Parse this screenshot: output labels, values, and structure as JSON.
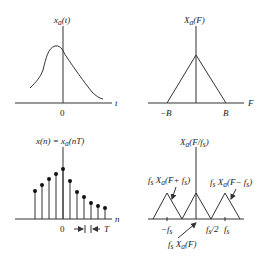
{
  "panels": {
    "analog_signal": {
      "title": "x_a(t)",
      "title_main": "x",
      "title_sub": "a",
      "title_rest": "(t)",
      "x_axis_label": "t",
      "origin_label": "0"
    },
    "analog_spectrum": {
      "title_main": "X",
      "title_sub": "a",
      "title_rest": "(F)",
      "x_axis_label": "F",
      "tick_left": "−B",
      "tick_right": "B"
    },
    "sampled_signal": {
      "title_main": "x(n) = x",
      "title_sub": "a",
      "title_rest": "(nT)",
      "x_axis_label": "n",
      "origin_label": "0",
      "period_label": "T",
      "sample_heights": [
        28,
        34,
        40,
        45,
        50,
        38,
        27,
        22,
        16,
        13,
        11
      ]
    },
    "sampled_spectrum": {
      "title_main": "X",
      "title_sub": "a",
      "title_rest": "(F/f",
      "title_sub2": "s",
      "title_end": ")",
      "annot_left": "f",
      "annot_left_sub": "s",
      "annot_left_mid": "X",
      "annot_left_sub2": "a",
      "annot_left_rest": "(F+ f",
      "annot_left_sub3": "s",
      "annot_left_end": ")",
      "annot_right_rest": "(F− f",
      "annot_center_rest": "(F)",
      "tick_neg_fs": "−f",
      "tick_half": "f",
      "tick_half_rest": "/2",
      "tick_fs": "f"
    }
  }
}
